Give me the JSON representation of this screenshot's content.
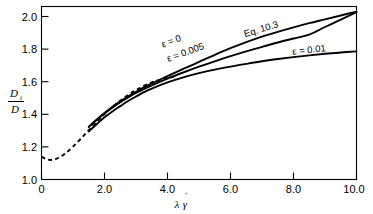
{
  "chart_data": {
    "type": "line",
    "title": "",
    "xlabel": "λγ̇",
    "ylabel": "Dᵢ/D",
    "xlim": [
      0,
      10
    ],
    "ylim": [
      1.0,
      2.08
    ],
    "grid": false,
    "legend_position": "inline-annotations",
    "xticks": [
      "0",
      "2.0",
      "4.0",
      "6.0",
      "8.0",
      "10.0"
    ],
    "xtick_values": [
      0,
      2,
      4,
      6,
      8,
      10
    ],
    "yticks": [
      "1.0",
      "1.2",
      "1.4",
      "1.6",
      "1.8",
      "2.0"
    ],
    "ytick_values": [
      1.0,
      1.2,
      1.4,
      1.6,
      1.8,
      2.0
    ],
    "series": [
      {
        "name": "ε = 0",
        "style": "dashed",
        "label": "ε = 0",
        "x": [
          0.0,
          0.15,
          0.3,
          0.5,
          0.75,
          1.0,
          1.25,
          1.5,
          1.75,
          2.0,
          2.25,
          2.5,
          2.75,
          3.0,
          3.25,
          3.5,
          3.75,
          4.0,
          4.2
        ],
        "y": [
          1.142,
          1.128,
          1.122,
          1.132,
          1.162,
          1.205,
          1.255,
          1.308,
          1.358,
          1.408,
          1.452,
          1.492,
          1.528,
          1.558,
          1.585,
          1.606,
          1.622,
          1.634,
          1.64
        ]
      },
      {
        "name": "ε = 0.005",
        "style": "solid",
        "label": "ε = 0.005",
        "x": [
          1.5,
          1.75,
          2.0,
          2.25,
          2.5,
          2.75,
          3.0,
          3.5,
          4.0,
          4.5,
          5.0,
          5.5,
          6.0,
          6.5,
          7.0,
          7.5,
          8.0,
          8.5,
          9.0,
          9.5,
          10.0
        ],
        "y": [
          1.328,
          1.372,
          1.412,
          1.448,
          1.482,
          1.512,
          1.54,
          1.588,
          1.63,
          1.668,
          1.704,
          1.738,
          1.77,
          1.8,
          1.828,
          1.855,
          1.88,
          1.905,
          1.952,
          1.998,
          2.045
        ]
      },
      {
        "name": "Eq. 10.3",
        "style": "solid",
        "label": "Eq. 10.3",
        "x": [
          1.5,
          2.0,
          2.5,
          3.0,
          3.5,
          4.0,
          4.5,
          5.0,
          5.5,
          6.0,
          6.5,
          7.0,
          7.5,
          8.0,
          8.5,
          9.0,
          9.5,
          10.0
        ],
        "y": [
          1.33,
          1.415,
          1.488,
          1.548,
          1.6,
          1.645,
          1.69,
          1.734,
          1.778,
          1.82,
          1.858,
          1.892,
          1.922,
          1.95,
          1.976,
          2.0,
          2.024,
          2.048
        ]
      },
      {
        "name": "ε = 0.01",
        "style": "solid",
        "label": "ε = 0.01",
        "x": [
          1.5,
          1.75,
          2.0,
          2.25,
          2.5,
          2.75,
          3.0,
          3.25,
          3.5,
          4.0,
          4.5,
          5.0,
          5.5,
          6.0,
          6.5,
          7.0,
          7.5,
          8.0,
          8.5,
          9.0,
          9.5,
          10.0
        ],
        "y": [
          1.3,
          1.345,
          1.388,
          1.425,
          1.458,
          1.49,
          1.518,
          1.545,
          1.568,
          1.606,
          1.638,
          1.664,
          1.686,
          1.705,
          1.722,
          1.738,
          1.752,
          1.764,
          1.775,
          1.785,
          1.793,
          1.8
        ]
      }
    ],
    "annotations": [
      {
        "text": "ε = 0",
        "x": 4.15,
        "y": 1.845,
        "rotation": -20
      },
      {
        "text": "ε = 0.005",
        "x": 4.6,
        "y": 1.775,
        "rotation": -20
      },
      {
        "text": "Eq. 10.3",
        "x": 7.0,
        "y": 1.92,
        "rotation": -17
      },
      {
        "text": "ε = 0.01",
        "x": 8.5,
        "y": 1.79,
        "rotation": -6
      }
    ]
  },
  "axis": {
    "y_numerator": "D",
    "y_numerator_sub": "i",
    "y_denominator": "D",
    "x_lambda": "λ",
    "x_gamma": "γ",
    "x_gamma_dot": "˙"
  }
}
